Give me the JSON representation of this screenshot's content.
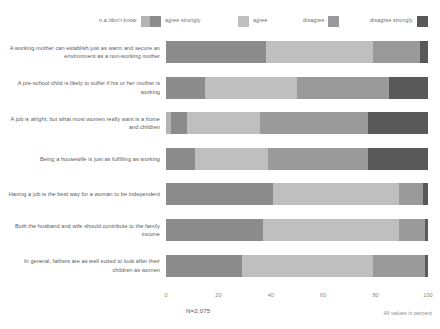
{
  "legend": {
    "items": [
      {
        "label": "n.a./don't know",
        "color": "#b4b4b4",
        "key": "na"
      },
      {
        "label": "agree strongly",
        "color": "#8c8c8c",
        "key": "agree_strongly"
      },
      {
        "label": "agree",
        "color": "#bfbfbf",
        "key": "agree"
      },
      {
        "label": "disagree",
        "color": "#9a9a9a",
        "key": "disagree"
      },
      {
        "label": "disagree strongly",
        "color": "#595959",
        "key": "disagree_strongly"
      }
    ]
  },
  "footnotes": {
    "sample": "N=2,075",
    "unit": "All values in percent"
  },
  "chart_data": {
    "type": "bar",
    "orientation": "horizontal",
    "stacked": true,
    "title": "",
    "xlabel": "",
    "ylabel": "",
    "xlim": [
      0,
      100
    ],
    "xticks": [
      0,
      20,
      40,
      60,
      80,
      100
    ],
    "grid": false,
    "legend_position": "top",
    "categories": [
      "A working mother can establish just as warm and secure an environment as a non-working mother",
      "A pre-school child is likely to suffer if his or her mother is working",
      "A job is alright, but what most women really want is a home and children",
      "Being a housewife is just as fulfilling as working",
      "Having a job is the best way for a woman to be independent",
      "Both the husband and wife should contribute to the family income",
      "In general, fathers are as well suited to look after their children as women"
    ],
    "series": [
      {
        "name": "n.a./don't know",
        "color": "#b4b4b4",
        "values": [
          0,
          0,
          2,
          0,
          0,
          0,
          0
        ]
      },
      {
        "name": "agree strongly",
        "color": "#8c8c8c",
        "values": [
          38,
          15,
          6,
          11,
          41,
          37,
          29
        ]
      },
      {
        "name": "agree",
        "color": "#bfbfbf",
        "values": [
          41,
          35,
          28,
          28,
          48,
          52,
          50
        ]
      },
      {
        "name": "disagree",
        "color": "#9a9a9a",
        "values": [
          18,
          35,
          41,
          38,
          9,
          10,
          20
        ]
      },
      {
        "name": "disagree strongly",
        "color": "#595959",
        "values": [
          3,
          15,
          23,
          23,
          2,
          1,
          1
        ]
      }
    ]
  }
}
